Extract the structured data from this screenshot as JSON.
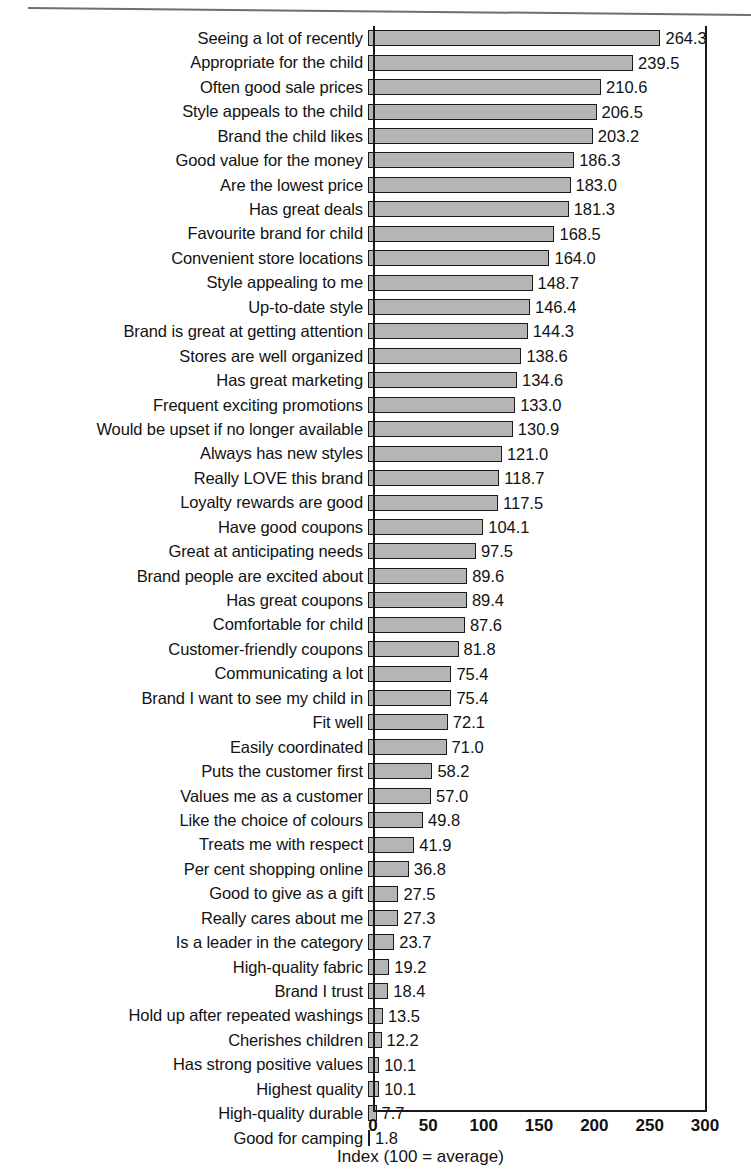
{
  "figure": {
    "top_rule": "horizontal-rule"
  },
  "chart_data": {
    "type": "bar",
    "orientation": "horizontal",
    "title": "",
    "subtitle": "",
    "xlabel": "Index (100 = average)",
    "ylabel": "",
    "xlim": [
      0,
      300
    ],
    "xticks": [
      0,
      50,
      100,
      150,
      200,
      250,
      300
    ],
    "xticklabels": [
      "0",
      "50",
      "100",
      "150",
      "200",
      "250",
      "300"
    ],
    "grid": false,
    "legend": null,
    "bar_color": "#b5b5b5",
    "bar_edge_color": "#1a1a1a",
    "categories": [
      "Seeing a lot of recently",
      "Appropriate for the child",
      "Often good sale prices",
      "Style appeals to the child",
      "Brand the child likes",
      "Good value for the money",
      "Are the lowest price",
      "Has great deals",
      "Favourite brand for child",
      "Convenient store locations",
      "Style appealing to me",
      "Up-to-date style",
      "Brand is great at getting attention",
      "Stores are well organized",
      "Has great marketing",
      "Frequent exciting promotions",
      "Would be upset if no longer available",
      "Always has new styles",
      "Really LOVE this brand",
      "Loyalty rewards are good",
      "Have good coupons",
      "Great at anticipating needs",
      "Brand people are excited about",
      "Has great coupons",
      "Comfortable for child",
      "Customer-friendly coupons",
      "Communicating a lot",
      "Brand I want to see my child in",
      "Fit well",
      "Easily coordinated",
      "Puts the customer first",
      "Values me as a customer",
      "Like the choice of colours",
      "Treats me with respect",
      "Per cent shopping online",
      "Good to give as a gift",
      "Really cares about me",
      "Is a leader in the category",
      "High-quality fabric",
      "Brand I trust",
      "Hold up after repeated washings",
      "Cherishes children",
      "Has strong positive values",
      "Highest quality",
      "High-quality durable",
      "Good for camping"
    ],
    "values": [
      264.3,
      239.5,
      210.6,
      206.5,
      203.2,
      186.3,
      183.0,
      181.3,
      168.5,
      164.0,
      148.7,
      146.4,
      144.3,
      138.6,
      134.6,
      133.0,
      130.9,
      121.0,
      118.7,
      117.5,
      104.1,
      97.5,
      89.6,
      89.4,
      87.6,
      81.8,
      75.4,
      75.4,
      72.1,
      71.0,
      58.2,
      57.0,
      49.8,
      41.9,
      36.8,
      27.5,
      27.3,
      23.7,
      19.2,
      18.4,
      13.5,
      12.2,
      10.1,
      10.1,
      7.7,
      1.8
    ],
    "value_labels": [
      "264.3",
      "239.5",
      "210.6",
      "206.5",
      "203.2",
      "186.3",
      "183.0",
      "181.3",
      "168.5",
      "164.0",
      "148.7",
      "146.4",
      "144.3",
      "138.6",
      "134.6",
      "133.0",
      "130.9",
      "121.0",
      "118.7",
      "117.5",
      "104.1",
      "97.5",
      "89.6",
      "89.4",
      "87.6",
      "81.8",
      "75.4",
      "75.4",
      "72.1",
      "71.0",
      "58.2",
      "57.0",
      "49.8",
      "41.9",
      "36.8",
      "27.5",
      "27.3",
      "23.7",
      "19.2",
      "18.4",
      "13.5",
      "12.2",
      "10.1",
      "10.1",
      "7.7",
      "1.8"
    ]
  }
}
